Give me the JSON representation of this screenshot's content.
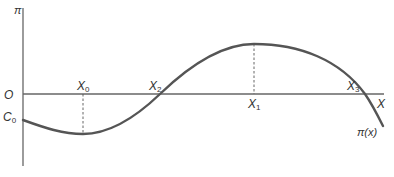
{
  "diagram": {
    "y_axis_label": "π",
    "origin_label": "O",
    "x_axis_label": "X",
    "intercept_label": "C",
    "intercept_sub": "0",
    "curve_label": "π(x)",
    "points": [
      {
        "name": "X",
        "sub": "0",
        "role": "minimum"
      },
      {
        "name": "X",
        "sub": "2",
        "role": "zero-crossing"
      },
      {
        "name": "X",
        "sub": "1",
        "role": "maximum"
      },
      {
        "name": "X",
        "sub": "3",
        "role": "zero-crossing"
      }
    ],
    "colors": {
      "curve": "#555555",
      "axis": "#666666",
      "text": "#333333"
    }
  }
}
